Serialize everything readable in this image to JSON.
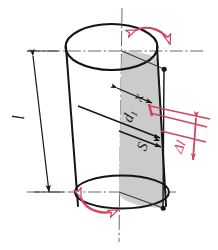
{
  "diagram": {
    "colors": {
      "outline": "#141414",
      "accent_red": "#d2445f",
      "shading": "#c9c9c9",
      "axis": "#555555"
    },
    "labels": {
      "length": "l",
      "distance_x": "x",
      "diameter_d1": "d",
      "diameter_d1_sub": "1",
      "point_s": "S",
      "delta_l": "Δl"
    },
    "annotations": {
      "rotation_top": "curved-double-arrow-top",
      "rotation_bottom": "curved-double-arrow-bottom",
      "dimension_length": "vertical-double-arrow-left",
      "dimension_delta": "vertical-double-arrow-right"
    },
    "icons": {
      "top_face": "ellipse-top",
      "bottom_face": "ellipse-bottom",
      "shaded_sector": "quarter-sector-shading",
      "center_axis": "dash-dot-vertical-axis"
    }
  }
}
